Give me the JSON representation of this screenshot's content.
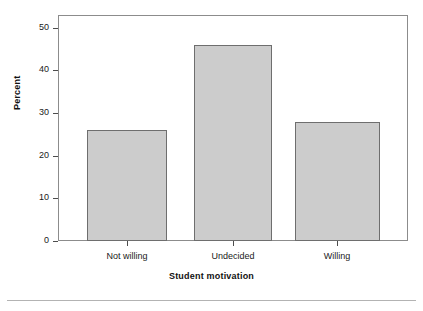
{
  "chart_data": {
    "type": "bar",
    "title": "",
    "categories": [
      "Not willing",
      "Undecided",
      "Willing"
    ],
    "values": [
      26,
      46,
      28
    ],
    "series": [
      {
        "name": "Percent",
        "values": [
          26,
          46,
          28
        ]
      }
    ],
    "xlabel": "Student motivation",
    "ylabel": "Percent",
    "ylim": [
      0,
      50
    ],
    "yticks": [
      0,
      10,
      20,
      30,
      40,
      50
    ],
    "ytick_labels": [
      "0",
      "10",
      "20",
      "30",
      "40",
      "50"
    ],
    "xtick_labels": [
      "Not willing",
      "Undecided",
      "Willing"
    ],
    "grid": false,
    "legend": null,
    "legend_position": "none",
    "bar_fill_color": "#cccccc",
    "bar_border_color": "#6e6e6e",
    "frame_color": "#8c8c8c",
    "background_color": "#ffffff",
    "text_color": "#1a1a1a"
  },
  "axes": {
    "y": {
      "title": "Percent",
      "ticks": [
        {
          "label": "50",
          "value": 50
        },
        {
          "label": "40",
          "value": 40
        },
        {
          "label": "30",
          "value": 30
        },
        {
          "label": "20",
          "value": 20
        },
        {
          "label": "10",
          "value": 10
        },
        {
          "label": "0",
          "value": 0
        }
      ]
    },
    "x": {
      "title": "Student motivation",
      "ticks": [
        {
          "label": "Not willing"
        },
        {
          "label": "Undecided"
        },
        {
          "label": "Willing"
        }
      ]
    }
  }
}
